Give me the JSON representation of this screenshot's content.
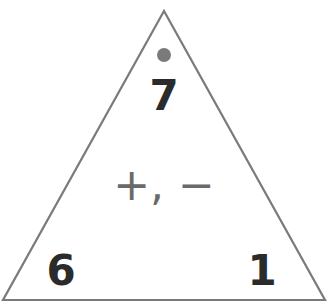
{
  "diagram": {
    "type": "fact-family-triangle",
    "top_number": "7",
    "bottom_left_number": "6",
    "bottom_right_number": "1",
    "operations": "+, −",
    "top_marker": "dot",
    "colors": {
      "outline": "#7a7a7a",
      "dot": "#7a7a7a",
      "numbers": "#2b2b2b",
      "operations": "#6a6a6a"
    }
  }
}
